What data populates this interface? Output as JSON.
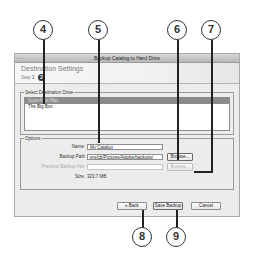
{
  "window": {
    "title": "Backup Catalog to Hard Drive",
    "traffic_lights": "◦ ◦",
    "header": {
      "title": "Destination Settings",
      "step_label": "Step:",
      "step_previous": "1",
      "step_current": "2"
    },
    "drive_group": {
      "legend": "Select Destination Drive",
      "drives": [
        {
          "label": "SuperFast Mac",
          "selected": true
        },
        {
          "label": "The Big Box",
          "selected": false
        }
      ]
    },
    "options_group": {
      "legend": "Options",
      "name_label": "Name:",
      "name_value": "My Catalog",
      "backup_path_label": "Backup Path",
      "backup_path_value": "ers/cb/Pictures/Adobe/backups/",
      "browse_label": "Browse...",
      "previous_backup_label": "Previous Backup File:",
      "previous_backup_value": "",
      "previous_browse_label": "Browse...",
      "size_label": "Size:",
      "size_value": "323.7 MB"
    },
    "buttons": {
      "back": "« Back",
      "save_backup": "Save Backup",
      "cancel": "Cancel"
    }
  },
  "callouts": [
    "4",
    "5",
    "6",
    "7",
    "8",
    "9"
  ]
}
